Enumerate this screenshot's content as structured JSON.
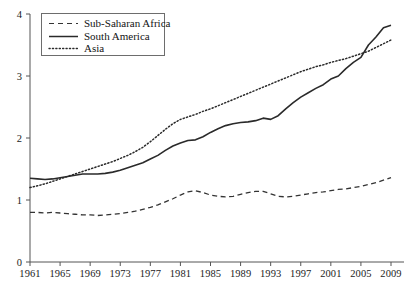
{
  "chart_data": {
    "type": "line",
    "title": "",
    "subtitle": "",
    "xlabel": "",
    "ylabel": "",
    "xlim": [
      1961,
      2009
    ],
    "ylim": [
      0,
      4
    ],
    "grid": false,
    "legend_position": "top-left",
    "x_ticks": [
      "1961",
      "1965",
      "1969",
      "1973",
      "1977",
      "1981",
      "1985",
      "1989",
      "1993",
      "1997",
      "2001",
      "2005",
      "2009"
    ],
    "x_tick_values": [
      1961,
      1965,
      1969,
      1973,
      1977,
      1981,
      1985,
      1989,
      1993,
      1997,
      2001,
      2005,
      2009
    ],
    "y_ticks": [
      "0",
      "1",
      "2",
      "3",
      "4"
    ],
    "y_tick_values": [
      0,
      1,
      2,
      3,
      4
    ],
    "x": [
      1961,
      1962,
      1963,
      1964,
      1965,
      1966,
      1967,
      1968,
      1969,
      1970,
      1971,
      1972,
      1973,
      1974,
      1975,
      1976,
      1977,
      1978,
      1979,
      1980,
      1981,
      1982,
      1983,
      1984,
      1985,
      1986,
      1987,
      1988,
      1989,
      1990,
      1991,
      1992,
      1993,
      1994,
      1995,
      1996,
      1997,
      1998,
      1999,
      2000,
      2001,
      2002,
      2003,
      2004,
      2005,
      2006,
      2007,
      2008,
      2009
    ],
    "series": [
      {
        "name": "Sub-Saharan Africa",
        "style": "dashed",
        "color": "#333333",
        "values": [
          0.8,
          0.8,
          0.79,
          0.8,
          0.79,
          0.78,
          0.77,
          0.76,
          0.76,
          0.75,
          0.76,
          0.77,
          0.78,
          0.8,
          0.82,
          0.85,
          0.88,
          0.92,
          0.97,
          1.02,
          1.08,
          1.13,
          1.15,
          1.12,
          1.08,
          1.06,
          1.05,
          1.06,
          1.09,
          1.12,
          1.14,
          1.14,
          1.1,
          1.06,
          1.05,
          1.06,
          1.08,
          1.1,
          1.12,
          1.13,
          1.15,
          1.17,
          1.18,
          1.2,
          1.22,
          1.25,
          1.28,
          1.32,
          1.36
        ]
      },
      {
        "name": "South America",
        "style": "solid",
        "color": "#2a2a2a",
        "values": [
          1.35,
          1.34,
          1.33,
          1.34,
          1.36,
          1.38,
          1.4,
          1.42,
          1.42,
          1.42,
          1.43,
          1.45,
          1.48,
          1.52,
          1.56,
          1.6,
          1.66,
          1.72,
          1.8,
          1.87,
          1.92,
          1.96,
          1.97,
          2.02,
          2.09,
          2.15,
          2.2,
          2.23,
          2.25,
          2.26,
          2.28,
          2.32,
          2.3,
          2.36,
          2.47,
          2.57,
          2.66,
          2.73,
          2.8,
          2.86,
          2.95,
          3.0,
          3.12,
          3.22,
          3.3,
          3.5,
          3.63,
          3.78,
          3.82
        ]
      },
      {
        "name": "Asia",
        "style": "dotted",
        "color": "#2a2a2a",
        "values": [
          1.2,
          1.23,
          1.26,
          1.3,
          1.34,
          1.38,
          1.42,
          1.46,
          1.5,
          1.54,
          1.58,
          1.62,
          1.67,
          1.72,
          1.78,
          1.85,
          1.94,
          2.04,
          2.14,
          2.23,
          2.3,
          2.34,
          2.38,
          2.43,
          2.47,
          2.52,
          2.57,
          2.62,
          2.67,
          2.72,
          2.77,
          2.82,
          2.87,
          2.92,
          2.97,
          3.02,
          3.07,
          3.11,
          3.15,
          3.18,
          3.22,
          3.25,
          3.28,
          3.32,
          3.36,
          3.4,
          3.46,
          3.52,
          3.58
        ]
      }
    ]
  },
  "legend": {
    "items": [
      {
        "label": "Sub-Saharan Africa",
        "style": "dashed"
      },
      {
        "label": "South America",
        "style": "solid"
      },
      {
        "label": "Asia",
        "style": "dotted"
      }
    ]
  },
  "axes": {
    "axis_color": "#555555",
    "line_color": "#2a2a2a"
  }
}
